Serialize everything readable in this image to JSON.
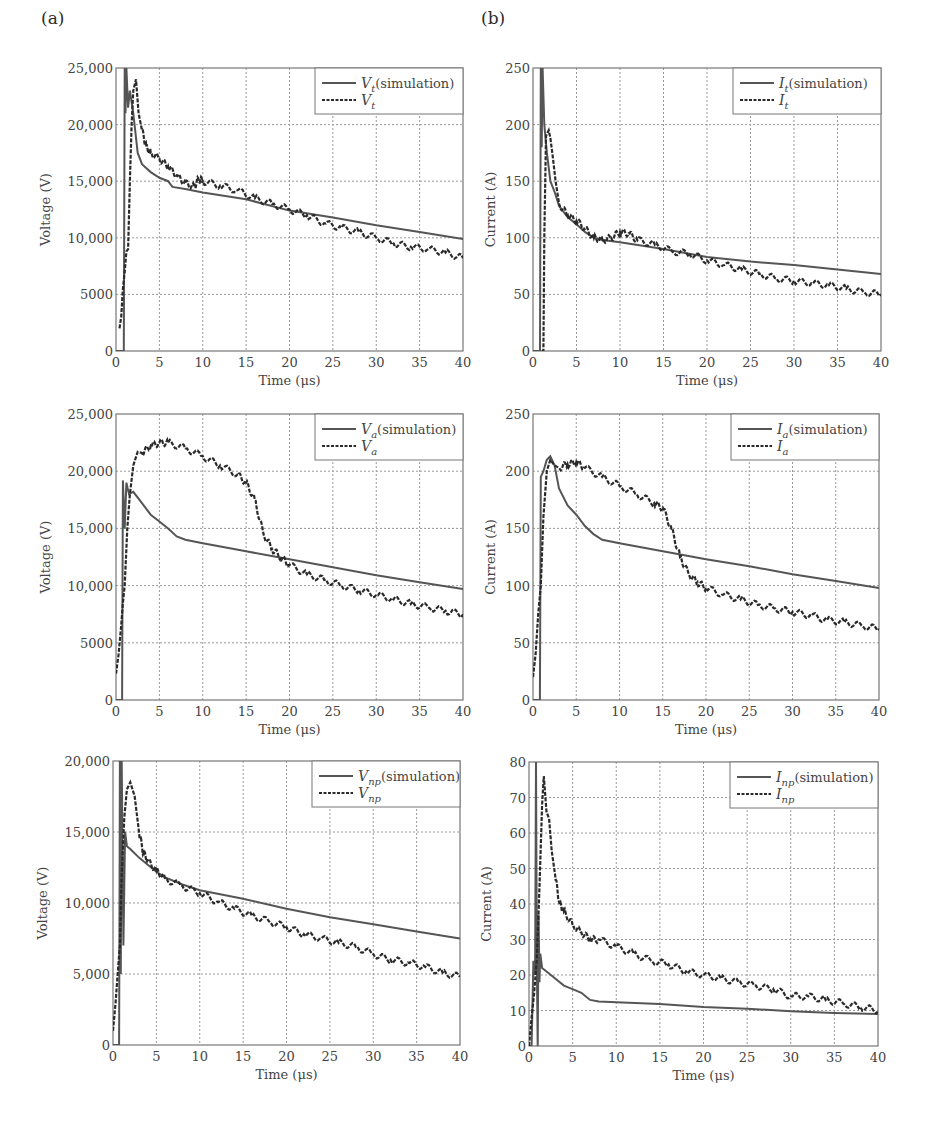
{
  "panel_labels": {
    "a": "(a)",
    "b": "(b)"
  },
  "chart_data": [
    {
      "id": "vt",
      "type": "line",
      "panel": "a",
      "position": "top-left",
      "xlabel": "Time (μs)",
      "ylabel": "Voltage (V)",
      "xlim": [
        0,
        40
      ],
      "ylim": [
        0,
        25000
      ],
      "xticks": [
        "0",
        "5",
        "10",
        "15",
        "20",
        "25",
        "30",
        "35",
        "40"
      ],
      "yticks": [
        "0",
        "5000",
        "10,000",
        "15,000",
        "20,000",
        "25,000"
      ],
      "grid": true,
      "legend_position": "top-right",
      "legend": [
        {
          "symbol": "V",
          "sub": "t",
          "suffix": "(simulation)",
          "style": "solid"
        },
        {
          "symbol": "V",
          "sub": "t",
          "suffix": "",
          "style": "dashed"
        }
      ],
      "series": [
        {
          "name": "Vt (simulation)",
          "style": "solid",
          "x": [
            0,
            0.9,
            1.0,
            1.1,
            1.2,
            1.4,
            1.6,
            2.0,
            2.5,
            3.0,
            4.0,
            5.0,
            6.0,
            6.5,
            8,
            10,
            15,
            20,
            25,
            30,
            35,
            40
          ],
          "y": [
            0,
            0,
            25000,
            21000,
            25000,
            21500,
            23000,
            21000,
            17500,
            16500,
            15800,
            15300,
            15000,
            14500,
            14300,
            14000,
            13400,
            12400,
            11800,
            11100,
            10500,
            9900
          ]
        },
        {
          "name": "Vt",
          "style": "dashed",
          "x": [
            0.4,
            0.6,
            0.8,
            1.0,
            1.2,
            1.4,
            1.6,
            1.8,
            2.0,
            2.3,
            2.6,
            3.0,
            3.5,
            4,
            5,
            6,
            7,
            8,
            9,
            9.5,
            10,
            12,
            14,
            16,
            18,
            20,
            22,
            24,
            26,
            28,
            30,
            32,
            34,
            36,
            38,
            40
          ],
          "y": [
            2000,
            3000,
            5500,
            7000,
            8800,
            9000,
            15000,
            20000,
            23000,
            24000,
            21000,
            19500,
            18000,
            17500,
            17000,
            16300,
            15500,
            14800,
            14500,
            15200,
            15000,
            14600,
            14200,
            13500,
            13000,
            12500,
            12000,
            11300,
            10900,
            10500,
            10000,
            9500,
            9200,
            9000,
            8700,
            8200
          ]
        }
      ]
    },
    {
      "id": "it",
      "type": "line",
      "panel": "b",
      "position": "top-right",
      "xlabel": "Time (μs)",
      "ylabel": "Current (A)",
      "xlim": [
        0,
        40
      ],
      "ylim": [
        0,
        250
      ],
      "xticks": [
        "0",
        "5",
        "10",
        "15",
        "20",
        "25",
        "30",
        "35",
        "40"
      ],
      "yticks": [
        "0",
        "50",
        "100",
        "150",
        "200",
        "250"
      ],
      "grid": true,
      "legend_position": "top-right",
      "legend": [
        {
          "symbol": "I",
          "sub": "t",
          "suffix": "(simulation)",
          "style": "solid"
        },
        {
          "symbol": "I",
          "sub": "t",
          "suffix": "",
          "style": "dashed"
        }
      ],
      "series": [
        {
          "name": "It (simulation)",
          "style": "solid",
          "x": [
            0,
            0.8,
            0.9,
            1.0,
            1.1,
            1.3,
            1.6,
            2.0,
            2.5,
            3,
            4,
            5,
            6,
            7,
            8,
            10,
            15,
            20,
            25,
            30,
            35,
            40
          ],
          "y": [
            0,
            0,
            250,
            180,
            250,
            200,
            175,
            150,
            140,
            128,
            118,
            112,
            105,
            100,
            98,
            96,
            90,
            83,
            79,
            76,
            72,
            68
          ]
        },
        {
          "name": "It",
          "style": "dashed",
          "x": [
            1.0,
            1.2,
            1.3,
            1.5,
            1.8,
            2.0,
            2.3,
            2.6,
            3,
            4,
            5,
            6,
            7,
            8,
            9,
            10,
            11,
            12,
            14,
            16,
            18,
            20,
            22,
            24,
            26,
            28,
            30,
            32,
            34,
            36,
            38,
            40
          ],
          "y": [
            0,
            0,
            100,
            190,
            195,
            188,
            170,
            150,
            130,
            120,
            115,
            108,
            100,
            98,
            100,
            105,
            104,
            98,
            94,
            88,
            86,
            80,
            76,
            72,
            68,
            64,
            62,
            60,
            58,
            55,
            52,
            50
          ]
        }
      ]
    },
    {
      "id": "va",
      "type": "line",
      "panel": "a",
      "position": "middle-left",
      "xlabel": "Time (μs)",
      "ylabel": "Voltage (V)",
      "xlim": [
        0,
        40
      ],
      "ylim": [
        0,
        25000
      ],
      "xticks": [
        "0",
        "5",
        "10",
        "15",
        "20",
        "25",
        "30",
        "35",
        "40"
      ],
      "yticks": [
        "0",
        "5000",
        "10,000",
        "15,000",
        "20,000",
        "25,000"
      ],
      "grid": true,
      "legend_position": "top-right",
      "legend": [
        {
          "symbol": "V",
          "sub": "a",
          "suffix": "(simulation)",
          "style": "solid"
        },
        {
          "symbol": "V",
          "sub": "a",
          "suffix": "",
          "style": "dashed"
        }
      ],
      "series": [
        {
          "name": "Va (simulation)",
          "style": "solid",
          "x": [
            0,
            0.7,
            0.8,
            1.0,
            1.2,
            1.5,
            2,
            3,
            4,
            5,
            6,
            7,
            8,
            10,
            15,
            20,
            25,
            30,
            35,
            40
          ],
          "y": [
            0,
            0,
            19200,
            15000,
            19000,
            18000,
            18200,
            17200,
            16200,
            15600,
            15000,
            14300,
            14000,
            13700,
            13000,
            12300,
            11600,
            10900,
            10300,
            9700
          ]
        },
        {
          "name": "Va",
          "style": "dashed",
          "x": [
            0,
            0.3,
            0.6,
            0.8,
            1.0,
            1.3,
            1.6,
            2,
            2.5,
            3,
            4,
            5,
            6,
            8,
            10,
            12,
            14,
            15,
            16,
            17,
            18,
            19,
            20,
            22,
            24,
            26,
            28,
            30,
            32,
            34,
            36,
            38,
            40
          ],
          "y": [
            2300,
            4000,
            6500,
            8500,
            10000,
            15000,
            18000,
            20500,
            21700,
            21600,
            22200,
            22500,
            22500,
            22000,
            21300,
            20500,
            19700,
            19000,
            17500,
            14500,
            13200,
            12500,
            11800,
            11000,
            10500,
            10000,
            9600,
            9200,
            8800,
            8400,
            8100,
            7800,
            7500
          ]
        }
      ]
    },
    {
      "id": "ia",
      "type": "line",
      "panel": "b",
      "position": "middle-right",
      "xlabel": "Time (μs)",
      "ylabel": "Current (A)",
      "xlim": [
        0,
        40
      ],
      "ylim": [
        0,
        250
      ],
      "xticks": [
        "0",
        "5",
        "10",
        "15",
        "20",
        "25",
        "30",
        "35",
        "40"
      ],
      "yticks": [
        "0",
        "50",
        "100",
        "150",
        "200",
        "250"
      ],
      "grid": true,
      "legend_position": "top-right",
      "legend": [
        {
          "symbol": "I",
          "sub": "a",
          "suffix": "(simulation)",
          "style": "solid"
        },
        {
          "symbol": "I",
          "sub": "a",
          "suffix": "",
          "style": "dashed"
        }
      ],
      "series": [
        {
          "name": "Ia (simulation)",
          "style": "solid",
          "x": [
            0,
            0.8,
            0.9,
            1.2,
            1.6,
            2.0,
            2.5,
            3,
            4,
            5,
            6,
            7,
            8,
            10,
            15,
            20,
            25,
            30,
            35,
            40
          ],
          "y": [
            0,
            0,
            195,
            200,
            210,
            213,
            205,
            185,
            170,
            162,
            152,
            145,
            140,
            137,
            130,
            123,
            117,
            110,
            104,
            98
          ]
        },
        {
          "name": "Ia",
          "style": "dashed",
          "x": [
            0,
            0.3,
            0.6,
            0.9,
            1.2,
            1.6,
            2,
            2.5,
            3,
            4,
            5,
            6,
            8,
            10,
            12,
            14,
            15,
            16,
            17,
            18,
            19,
            20,
            22,
            24,
            26,
            28,
            30,
            32,
            34,
            36,
            38,
            40
          ],
          "y": [
            20,
            40,
            75,
            100,
            160,
            200,
            210,
            205,
            203,
            206,
            208,
            203,
            195,
            187,
            180,
            172,
            168,
            150,
            125,
            110,
            103,
            98,
            92,
            88,
            83,
            80,
            77,
            74,
            70,
            68,
            65,
            62
          ]
        }
      ]
    },
    {
      "id": "vnp",
      "type": "line",
      "panel": "a",
      "position": "bottom-left",
      "xlabel": "Time (μs)",
      "ylabel": "Voltage (V)",
      "xlim": [
        0,
        40
      ],
      "ylim": [
        0,
        20000
      ],
      "xticks": [
        "0",
        "5",
        "10",
        "15",
        "20",
        "25",
        "30",
        "35",
        "40"
      ],
      "yticks": [
        "0",
        "5,000",
        "10,000",
        "15,000",
        "20,000"
      ],
      "grid": true,
      "legend_position": "top-right",
      "legend": [
        {
          "symbol": "V",
          "sub": "np",
          "suffix": "(simulation)",
          "style": "solid"
        },
        {
          "symbol": "V",
          "sub": "np",
          "suffix": "",
          "style": "dashed"
        }
      ],
      "series": [
        {
          "name": "Vnp (simulation)",
          "style": "solid",
          "x": [
            0,
            0.7,
            0.8,
            0.9,
            1.0,
            1.2,
            1.4,
            1.6,
            2,
            3,
            4,
            5,
            6,
            8,
            10,
            15,
            20,
            25,
            30,
            35,
            40
          ],
          "y": [
            0,
            0,
            20000,
            5000,
            20000,
            7000,
            15000,
            14000,
            13800,
            13200,
            12700,
            12200,
            11800,
            11300,
            10900,
            10300,
            9600,
            9000,
            8500,
            8000,
            7500
          ]
        },
        {
          "name": "Vnp",
          "style": "dashed",
          "x": [
            0,
            0.3,
            0.6,
            0.8,
            1.0,
            1.3,
            1.6,
            2,
            2.5,
            3,
            3.5,
            4,
            5,
            6,
            8,
            10,
            12,
            14,
            16,
            18,
            20,
            22,
            24,
            26,
            28,
            30,
            32,
            34,
            36,
            38,
            40
          ],
          "y": [
            1000,
            3000,
            5500,
            7000,
            12000,
            16000,
            18000,
            18500,
            17500,
            15000,
            13500,
            13000,
            12300,
            11700,
            11200,
            10700,
            10100,
            9600,
            9100,
            8700,
            8300,
            7800,
            7500,
            7200,
            6900,
            6400,
            6000,
            5800,
            5500,
            5100,
            4800
          ]
        }
      ]
    },
    {
      "id": "inp",
      "type": "line",
      "panel": "b",
      "position": "bottom-right",
      "xlabel": "Time (μs)",
      "ylabel": "Current (A)",
      "xlim": [
        0,
        40
      ],
      "ylim": [
        0,
        80
      ],
      "xticks": [
        "0",
        "5",
        "10",
        "15",
        "20",
        "25",
        "30",
        "35",
        "40"
      ],
      "yticks": [
        "0",
        "10",
        "20",
        "30",
        "40",
        "50",
        "60",
        "70",
        "80"
      ],
      "grid": true,
      "legend_position": "top-right",
      "legend": [
        {
          "symbol": "I",
          "sub": "np",
          "suffix": "(simulation)",
          "style": "solid"
        },
        {
          "symbol": "I",
          "sub": "np",
          "suffix": "",
          "style": "dashed"
        }
      ],
      "series": [
        {
          "name": "Inp (simulation)",
          "style": "solid",
          "x": [
            0,
            0.3,
            0.5,
            0.7,
            0.8,
            0.9,
            1.0,
            1.1,
            1.2,
            1.3,
            1.5,
            2,
            3,
            4,
            5,
            6,
            7,
            8,
            10,
            15,
            20,
            25,
            30,
            35,
            40
          ],
          "y": [
            0,
            0,
            24,
            20,
            80,
            22,
            0,
            37,
            18,
            26,
            22,
            21,
            19,
            17,
            16,
            15,
            13,
            12.5,
            12.3,
            11.8,
            11,
            10.5,
            9.8,
            9.3,
            9
          ]
        },
        {
          "name": "Inp",
          "style": "dashed",
          "x": [
            0,
            0.3,
            0.6,
            0.9,
            1.2,
            1.5,
            1.7,
            2.0,
            2.3,
            2.6,
            3,
            3.5,
            4,
            5,
            6,
            7,
            8,
            10,
            12,
            14,
            16,
            18,
            20,
            22,
            24,
            26,
            28,
            30,
            32,
            34,
            36,
            38,
            40
          ],
          "y": [
            0,
            8,
            15,
            25,
            45,
            68,
            76,
            66,
            64,
            55,
            48,
            40,
            38,
            34,
            32,
            30,
            30,
            28,
            26,
            24,
            23,
            21,
            20,
            19,
            18,
            17,
            16,
            14,
            14,
            13,
            12,
            11,
            10
          ]
        }
      ]
    }
  ]
}
